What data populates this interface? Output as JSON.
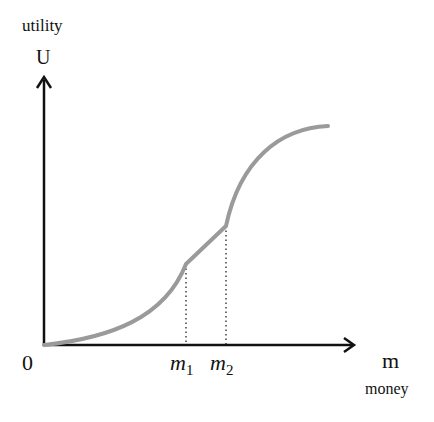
{
  "diagram": {
    "y_axis": {
      "label_top": "utility",
      "symbol": "U"
    },
    "x_axis": {
      "symbol": "m",
      "label_bottom": "money"
    },
    "origin_label": "0",
    "ticks": [
      {
        "base": "m",
        "sub": "1"
      },
      {
        "base": "m",
        "sub": "2"
      }
    ],
    "colors": {
      "curve": "#9a9a9a",
      "axis": "#111111"
    },
    "curve_description": "convex from 0 to m1, linear from m1 to m2, concave beyond m2"
  }
}
